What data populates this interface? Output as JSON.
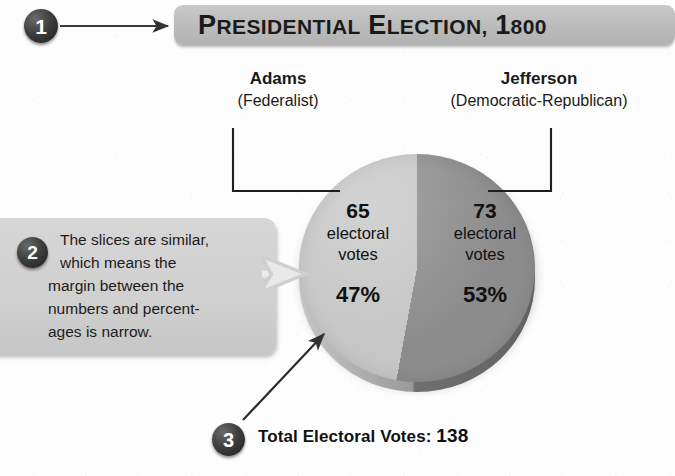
{
  "title": {
    "text": "Presidential Election, 1800",
    "banner_color": "#bdbdbd",
    "text_color": "#1a1a1a"
  },
  "badges": {
    "one": "1",
    "two": "2",
    "three": "3",
    "color": "#2a2a2a",
    "text_color": "#ffffff"
  },
  "candidates": {
    "left": {
      "name": "Adams",
      "party": "(Federalist)"
    },
    "right": {
      "name": "Jefferson",
      "party": "(Democratic-Republican)"
    }
  },
  "callout": {
    "line1": "The slices are similar,",
    "line2": "which means the",
    "line3": "margin between the",
    "line4": "numbers and percent-",
    "line5": "ages is narrow.",
    "bg_color": "#d0d0d0"
  },
  "slices": {
    "left": {
      "votes": "65",
      "unit_line1": "electoral",
      "unit_line2": "votes",
      "percent": "47%",
      "color": "#c6c6c6"
    },
    "right": {
      "votes": "73",
      "unit_line1": "electoral",
      "unit_line2": "votes",
      "percent": "53%",
      "color": "#8c8c8c"
    }
  },
  "total": {
    "label": "Total Electoral Votes:",
    "value": "138"
  },
  "chart_data": {
    "type": "pie",
    "title": "Presidential Election, 1800",
    "categories": [
      "Adams (Federalist)",
      "Jefferson (Democratic-Republican)"
    ],
    "values": [
      65,
      73
    ],
    "percentages": [
      47,
      53
    ],
    "value_unit": "electoral votes",
    "total": 138,
    "total_label": "Total Electoral Votes: 138",
    "colors": [
      "#c6c6c6",
      "#8c8c8c"
    ],
    "legend": "external-labels",
    "start_angle_deg": 0,
    "direction": "clockwise",
    "annotations": [
      "1 — title banner callout",
      "2 — The slices are similar, which means the margin between the numbers and percentages is narrow.",
      "3 — Total Electoral Votes: 138"
    ],
    "xlabel": "",
    "ylabel": "",
    "grid": false
  }
}
